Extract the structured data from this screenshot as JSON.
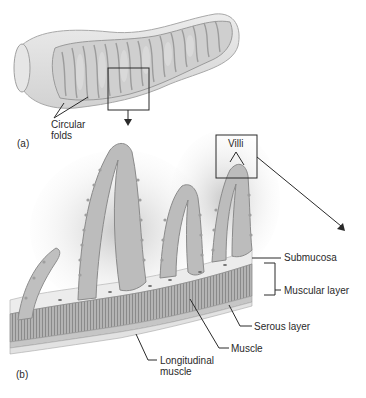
{
  "figure": {
    "panel_a": {
      "tag": "(a)",
      "labels": {
        "circular_folds_line1": "Circular",
        "circular_folds_line2": "folds"
      }
    },
    "panel_b": {
      "tag": "(b)",
      "labels": {
        "villi": "Villi",
        "submucosa": "Submucosa",
        "muscular_layer": "Muscular layer",
        "serous_layer": "Serous layer",
        "muscle": "Muscle",
        "longitudinal_muscle_line1": "Longitudinal",
        "longitudinal_muscle_line2": "muscle"
      }
    },
    "colors": {
      "background": "#ffffff",
      "tissue_light": "#e4e4e4",
      "tissue_mid": "#bdbdbd",
      "tissue_dark": "#8e8e8e",
      "line": "#2a2a2a"
    }
  }
}
